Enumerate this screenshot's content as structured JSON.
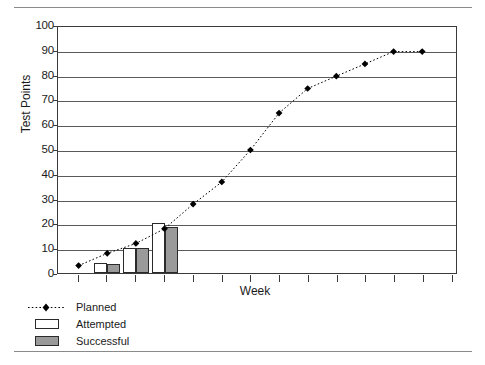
{
  "chart_data": {
    "type": "line",
    "title": "",
    "xlabel": "Week",
    "ylabel": "Test Points",
    "ylim": [
      0,
      100
    ],
    "ytick_labels": [
      "100",
      "90",
      "80",
      "70",
      "60",
      "50",
      "40",
      "30",
      "20",
      "10",
      "0"
    ],
    "ytick_values": [
      100,
      90,
      80,
      70,
      60,
      50,
      40,
      30,
      20,
      10,
      0
    ],
    "xtick_labels": [],
    "xtick_count": 14,
    "grid": true,
    "legend_position": "below-left",
    "x": [
      1,
      2,
      3,
      4,
      5,
      6,
      7,
      8,
      9,
      10,
      11,
      12,
      13
    ],
    "series": [
      {
        "name": "Planned",
        "style": "dotted-line-diamond-marker",
        "color": "#000000",
        "values": [
          3,
          8,
          12,
          18,
          28,
          37,
          50,
          65,
          75,
          80,
          85,
          90,
          90
        ]
      },
      {
        "name": "Attempted",
        "style": "bar-outline",
        "color": "#ffffff",
        "values": [
          null,
          4,
          10,
          20,
          null,
          null,
          null,
          null,
          null,
          null,
          null,
          null,
          null
        ]
      },
      {
        "name": "Successful",
        "style": "bar-filled",
        "color": "#9a9a9a",
        "values": [
          null,
          3.5,
          10,
          18.5,
          null,
          null,
          null,
          null,
          null,
          null,
          null,
          null,
          null
        ]
      }
    ]
  },
  "legend": {
    "items": [
      {
        "label": "Planned",
        "marker": "dotted-diamond"
      },
      {
        "label": "Attempted",
        "marker": "white-bar"
      },
      {
        "label": "Successful",
        "marker": "gray-bar"
      }
    ]
  },
  "axes": {
    "y_title": "Test Points",
    "x_title": "Week"
  },
  "colors": {
    "successful_fill": "#9a9a9a",
    "attempted_fill": "#ffffff",
    "line": "#000000",
    "grid": "#5a5a5a",
    "frame": "#3a3a3a",
    "rule": "#8a8a8a"
  }
}
